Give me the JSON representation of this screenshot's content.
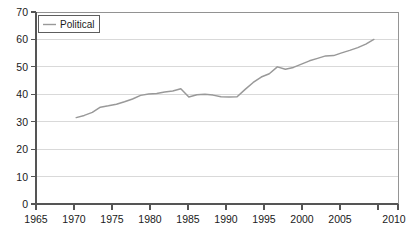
{
  "figure": {
    "width": 417,
    "height": 233,
    "background": "#ffffff",
    "title_clipped": "",
    "line_color": "#999999",
    "grid_color": "#cfcfcf",
    "axis_color": "#555555",
    "text_color": "#1a1a1a"
  },
  "legend": {
    "entries": [
      "Political"
    ],
    "position": "top-left-inside",
    "label": "Political"
  },
  "axes": {
    "x": {
      "label": "",
      "min": 1965,
      "max": 2010,
      "tick_step": 5,
      "ticks": [
        "1965",
        "1970",
        "1975",
        "1980",
        "1985",
        "1990",
        "1995",
        "2000",
        "2005",
        "2010"
      ]
    },
    "y": {
      "label": "",
      "min": 0,
      "max": 70,
      "tick_step": 10,
      "ticks": [
        "0",
        "10",
        "20",
        "30",
        "40",
        "50",
        "60",
        "70"
      ]
    }
  },
  "chart_data": {
    "type": "line",
    "title": "",
    "xlabel": "",
    "ylabel": "",
    "xlim": [
      1965,
      2010
    ],
    "ylim": [
      0,
      70
    ],
    "grid": true,
    "legend_position": "upper left",
    "series": [
      {
        "name": "Political",
        "color": "#999999",
        "x": [
          1970,
          1971,
          1972,
          1973,
          1974,
          1975,
          1976,
          1977,
          1978,
          1979,
          1980,
          1981,
          1982,
          1983,
          1984,
          1985,
          1986,
          1987,
          1988,
          1989,
          1990,
          1991,
          1992,
          1993,
          1994,
          1995,
          1996,
          1997,
          1998,
          1999,
          2000,
          2001,
          2002,
          2003,
          2004,
          2005,
          2006,
          2007
        ],
        "values": [
          31.5,
          32.3,
          33.4,
          35.3,
          35.8,
          36.4,
          37.3,
          38.3,
          39.6,
          40.1,
          40.3,
          40.8,
          41.2,
          42.0,
          39.0,
          39.8,
          40.0,
          39.7,
          39.1,
          39.0,
          39.1,
          41.8,
          44.3,
          46.3,
          47.5,
          50.0,
          49.1,
          49.8,
          51.0,
          52.2,
          53.1,
          54.0,
          54.1,
          55.1,
          56.0,
          57.0,
          58.3,
          60.0
        ]
      }
    ]
  }
}
